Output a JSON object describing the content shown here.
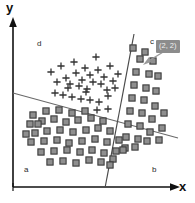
{
  "figure": {
    "caption": "",
    "background_color": "#ffffff"
  },
  "axes": {
    "x_label": "x",
    "y_label": "y",
    "axis_color": "#111111",
    "origin": [
      13,
      187
    ]
  },
  "region_labels": {
    "a": "a",
    "b": "b",
    "c": "c",
    "d": "d"
  },
  "annotation": {
    "tooltip_text": "(2, 2)",
    "tooltip_bg": "#8c8c8c",
    "tooltip_fg": "#f2f2f2",
    "pointer_color": "#9a9a9a",
    "target_point": [
      142,
      59
    ]
  },
  "chart_data": {
    "type": "scatter",
    "title": "",
    "xlabel": "x",
    "ylabel": "y",
    "grid": false,
    "legend": null,
    "xlim": [
      0,
      195
    ],
    "ylim": [
      0,
      203
    ],
    "note": "Pixel coordinates in figure space; y increases downward.",
    "series": [
      {
        "name": "plus-cluster",
        "marker": "plus",
        "color": "#333333",
        "points": [
          [
            51,
            72
          ],
          [
            57,
            82
          ],
          [
            61,
            66
          ],
          [
            66,
            78
          ],
          [
            70,
            84
          ],
          [
            74,
            62
          ],
          [
            76,
            73
          ],
          [
            79,
            86
          ],
          [
            82,
            80
          ],
          [
            85,
            68
          ],
          [
            87,
            89
          ],
          [
            90,
            75
          ],
          [
            93,
            82
          ],
          [
            96,
            57
          ],
          [
            98,
            70
          ],
          [
            101,
            84
          ],
          [
            104,
            77
          ],
          [
            107,
            90
          ],
          [
            110,
            66
          ],
          [
            113,
            81
          ],
          [
            55,
            93
          ],
          [
            63,
            95
          ],
          [
            72,
            97
          ],
          [
            81,
            99
          ],
          [
            90,
            100
          ],
          [
            99,
            102
          ],
          [
            108,
            96
          ],
          [
            97,
            110
          ],
          [
            108,
            109
          ],
          [
            86,
            92
          ],
          [
            68,
            88
          ],
          [
            118,
            74
          ],
          [
            115,
            88
          ]
        ]
      },
      {
        "name": "square-cluster-left",
        "marker": "square",
        "color": "#8f8f8f",
        "edge_color": "#3a3a3a",
        "points": [
          [
            33,
            115
          ],
          [
            46,
            111
          ],
          [
            59,
            110
          ],
          [
            72,
            113
          ],
          [
            85,
            111
          ],
          [
            30,
            124
          ],
          [
            42,
            121
          ],
          [
            54,
            119
          ],
          [
            66,
            122
          ],
          [
            78,
            120
          ],
          [
            91,
            118
          ],
          [
            103,
            121
          ],
          [
            35,
            133
          ],
          [
            47,
            131
          ],
          [
            60,
            130
          ],
          [
            73,
            132
          ],
          [
            86,
            130
          ],
          [
            98,
            128
          ],
          [
            110,
            131
          ],
          [
            31,
            142
          ],
          [
            44,
            141
          ],
          [
            57,
            140
          ],
          [
            69,
            143
          ],
          [
            82,
            141
          ],
          [
            95,
            139
          ],
          [
            107,
            142
          ],
          [
            119,
            140
          ],
          [
            41,
            152
          ],
          [
            54,
            151
          ],
          [
            67,
            150
          ],
          [
            80,
            152
          ],
          [
            92,
            150
          ],
          [
            104,
            153
          ],
          [
            116,
            151
          ],
          [
            50,
            162
          ],
          [
            63,
            161
          ],
          [
            76,
            163
          ],
          [
            89,
            160
          ],
          [
            101,
            162
          ],
          [
            113,
            159
          ],
          [
            26,
            134
          ],
          [
            38,
            124
          ],
          [
            125,
            148
          ],
          [
            110,
            165
          ]
        ]
      },
      {
        "name": "square-cluster-right",
        "marker": "square",
        "color": "#8f8f8f",
        "edge_color": "#3a3a3a",
        "points": [
          [
            140,
            59
          ],
          [
            153,
            61
          ],
          [
            136,
            72
          ],
          [
            149,
            74
          ],
          [
            134,
            85
          ],
          [
            146,
            88
          ],
          [
            158,
            76
          ],
          [
            132,
            98
          ],
          [
            144,
            100
          ],
          [
            156,
            91
          ],
          [
            130,
            111
          ],
          [
            142,
            113
          ],
          [
            155,
            106
          ],
          [
            128,
            124
          ],
          [
            140,
            126
          ],
          [
            152,
            119
          ],
          [
            164,
            113
          ],
          [
            126,
            137
          ],
          [
            138,
            139
          ],
          [
            150,
            132
          ],
          [
            162,
            128
          ],
          [
            123,
            150
          ],
          [
            135,
            147
          ],
          [
            147,
            141
          ],
          [
            159,
            140
          ],
          [
            145,
            52
          ],
          [
            133,
            48
          ]
        ]
      }
    ],
    "decision_boundaries": [
      {
        "name": "steep-boundary",
        "from": [
          134,
          34
        ],
        "to": [
          105,
          188
        ],
        "color": "#4a4a4a",
        "width": 1.2
      },
      {
        "name": "shallow-boundary",
        "from": [
          13,
          93
        ],
        "to": [
          178,
          138
        ],
        "color": "#6a6a6a",
        "width": 1.1
      }
    ]
  }
}
